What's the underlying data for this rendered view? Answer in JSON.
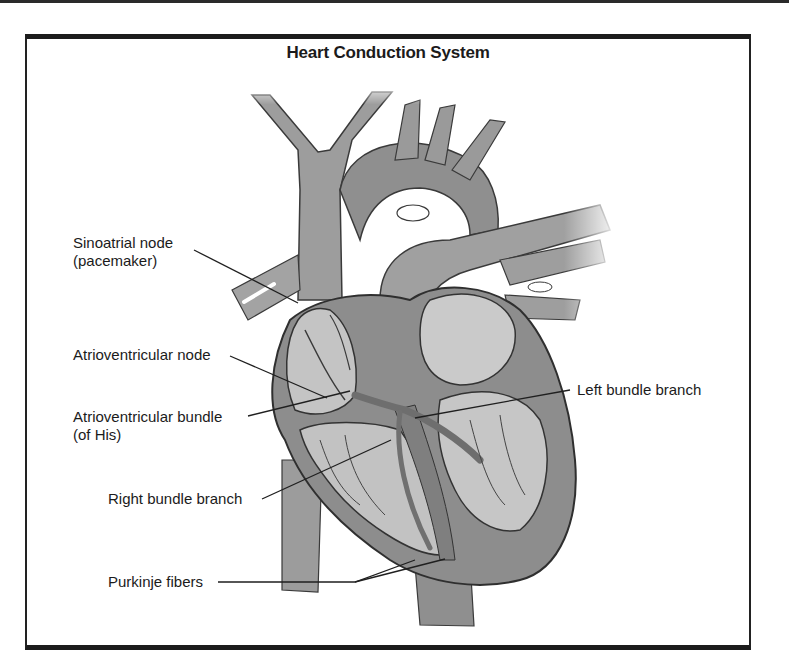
{
  "figure": {
    "title": "Heart Conduction System",
    "labels": {
      "sinoatrial_node": {
        "line1": "Sinoatrial node",
        "line2": "(pacemaker)"
      },
      "atrioventricular_node": {
        "line1": "Atrioventricular node"
      },
      "atrioventricular_bundle": {
        "line1": "Atrioventricular bundle",
        "line2": "(of His)"
      },
      "right_bundle_branch": {
        "line1": "Right bundle branch"
      },
      "left_bundle_branch": {
        "line1": "Left bundle branch"
      },
      "purkinje_fibers": {
        "line1": "Purkinje fibers"
      }
    },
    "colors": {
      "vessel_gray": "#9a9a9a",
      "muscle_gray": "#8c8c8c",
      "chamber_light": "#c9c9c9",
      "outline": "#3a3a3a",
      "conduction_gray": "#7d7d7d",
      "frame": "#1c1c1c"
    }
  }
}
